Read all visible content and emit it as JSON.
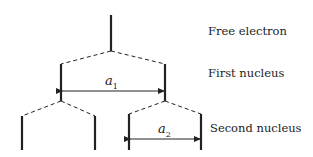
{
  "labels": {
    "free_electron": "Free electron",
    "first_nucleus": "First nucleus",
    "second_nucleus": "Second nucleus"
  },
  "symbols": {
    "a1": {
      "base": "a",
      "sub": "1"
    },
    "a2": {
      "base": "a",
      "sub": "2"
    }
  },
  "colors": {
    "line": "#222222",
    "background": "#ffffff"
  }
}
